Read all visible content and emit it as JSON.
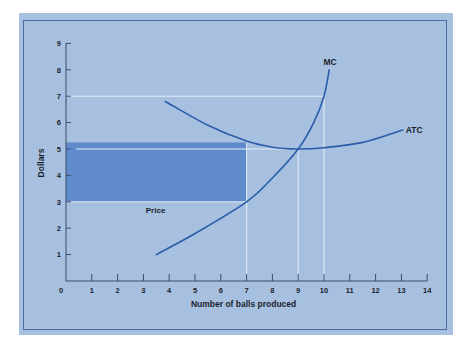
{
  "chart_data": {
    "type": "line",
    "title": "",
    "xlabel": "Number of balls produced",
    "ylabel": "Dollars",
    "xlim": [
      0,
      14
    ],
    "ylim": [
      0,
      9
    ],
    "x_ticks": [
      0,
      1,
      2,
      3,
      4,
      5,
      6,
      7,
      8,
      9,
      10,
      11,
      12,
      13,
      14
    ],
    "y_ticks": [
      1,
      2,
      3,
      4,
      5,
      6,
      7,
      8,
      9
    ],
    "grid": false,
    "series": [
      {
        "name": "MC",
        "label": "MC",
        "points": [
          [
            3.5,
            1.0
          ],
          [
            5,
            1.8
          ],
          [
            7,
            3.0
          ],
          [
            8,
            3.9
          ],
          [
            9,
            5.0
          ],
          [
            9.6,
            6.0
          ],
          [
            10,
            7.0
          ],
          [
            10.2,
            8.0
          ]
        ]
      },
      {
        "name": "ATC",
        "label": "ATC",
        "points": [
          [
            3.85,
            6.8
          ],
          [
            5.5,
            5.9
          ],
          [
            7,
            5.3
          ],
          [
            8,
            5.07
          ],
          [
            9,
            5.0
          ],
          [
            10,
            5.05
          ],
          [
            11.5,
            5.25
          ],
          [
            13.05,
            5.72
          ]
        ]
      }
    ],
    "shaded_region": {
      "x": [
        0,
        7
      ],
      "y": [
        3,
        5.25
      ],
      "color": "#5f8acb"
    },
    "reference_lines": [
      {
        "orientation": "horizontal",
        "y": 7,
        "x_range": [
          0,
          10
        ]
      },
      {
        "orientation": "horizontal",
        "y": 5,
        "x_range": [
          0.4,
          9
        ]
      },
      {
        "orientation": "horizontal",
        "y": 3,
        "x_range": [
          0,
          7
        ]
      },
      {
        "orientation": "vertical",
        "x": 7,
        "y_range": [
          0,
          5.25
        ]
      },
      {
        "orientation": "vertical",
        "x": 9,
        "y_range": [
          0,
          5
        ]
      },
      {
        "orientation": "vertical",
        "x": 10,
        "y_range": [
          0,
          7
        ]
      }
    ],
    "annotations": [
      {
        "text": "Price",
        "x": 3.2,
        "y": 2.6
      }
    ],
    "colors": {
      "background": "#a8c0e0",
      "curve": "#2a5caa",
      "shaded": "#5f8acb",
      "reference_line": "#e4ecf7",
      "axis": "#3a4a6a",
      "border": "#4a6aa8"
    }
  }
}
